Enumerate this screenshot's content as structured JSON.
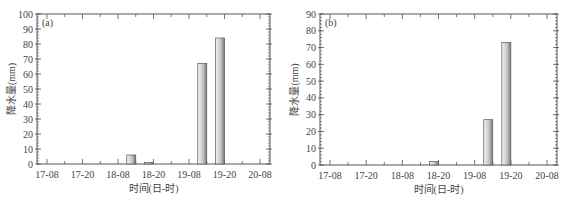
{
  "chart_data": [
    {
      "type": "bar",
      "panel_label": "(a)",
      "title": "",
      "xlabel": "时间(日-时)",
      "ylabel": "降水量(mm)",
      "ylim": [
        0,
        100
      ],
      "yticks": [
        0,
        10,
        20,
        30,
        40,
        50,
        60,
        70,
        80,
        90,
        100
      ],
      "xticks": [
        "17-08",
        "17-20",
        "18-08",
        "18-20",
        "19-08",
        "19-20",
        "20-08"
      ],
      "grid": false,
      "bars": [
        {
          "x_hours": 30,
          "label": "18-14",
          "value": 6
        },
        {
          "x_hours": 36,
          "label": "18-20",
          "value": 1
        },
        {
          "x_hours": 54,
          "label": "19-14",
          "value": 67
        },
        {
          "x_hours": 60,
          "label": "19-20",
          "value": 84
        }
      ]
    },
    {
      "type": "bar",
      "panel_label": "(b)",
      "title": "",
      "xlabel": "时间(日-时)",
      "ylabel": "降水量(mm)",
      "ylim": [
        0,
        90
      ],
      "yticks": [
        0,
        10,
        20,
        30,
        40,
        50,
        60,
        70,
        80,
        90
      ],
      "xticks": [
        "17-08",
        "17-20",
        "18-08",
        "18-20",
        "19-08",
        "19-20",
        "20-08"
      ],
      "grid": false,
      "bars": [
        {
          "x_hours": 36,
          "label": "18-20",
          "value": 2
        },
        {
          "x_hours": 54,
          "label": "19-14",
          "value": 27
        },
        {
          "x_hours": 60,
          "label": "19-20",
          "value": 73
        }
      ]
    }
  ],
  "colors": {
    "axis": "#555555",
    "bar_light": "#f4f4f4",
    "bar_dark": "#7a7a7a",
    "bar_edge": "#555555"
  }
}
